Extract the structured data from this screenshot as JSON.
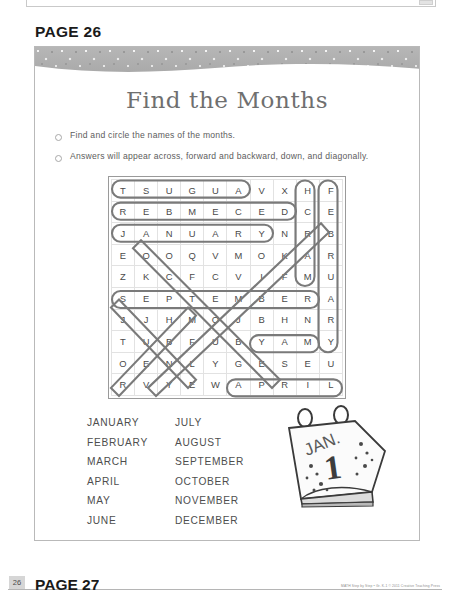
{
  "page_heading": "PAGE 26",
  "next_page_heading": "PAGE 27",
  "worksheet": {
    "title": "Find the Months",
    "instructions": [
      "Find and circle the names of the months.",
      "Answers will appear across, forward and backward, down, and diagonally."
    ],
    "bullet_icon": "circle-outline-icon"
  },
  "puzzle": {
    "type": "word-search",
    "rows": 10,
    "cols": 10,
    "grid": [
      [
        "T",
        "S",
        "U",
        "G",
        "U",
        "A",
        "V",
        "X",
        "H",
        "F"
      ],
      [
        "R",
        "E",
        "B",
        "M",
        "E",
        "C",
        "E",
        "D",
        "C",
        "E"
      ],
      [
        "J",
        "A",
        "N",
        "U",
        "A",
        "R",
        "Y",
        "N",
        "R",
        "B"
      ],
      [
        "E",
        "O",
        "O",
        "Q",
        "V",
        "M",
        "O",
        "K",
        "A",
        "R"
      ],
      [
        "Z",
        "K",
        "C",
        "F",
        "C",
        "V",
        "I",
        "F",
        "M",
        "U"
      ],
      [
        "S",
        "E",
        "P",
        "T",
        "E",
        "M",
        "B",
        "E",
        "R",
        "A"
      ],
      [
        "J",
        "J",
        "H",
        "M",
        "O",
        "J",
        "B",
        "H",
        "N",
        "R"
      ],
      [
        "T",
        "U",
        "B",
        "F",
        "U",
        "B",
        "Y",
        "A",
        "M",
        "Y"
      ],
      [
        "O",
        "E",
        "N",
        "L",
        "Y",
        "G",
        "E",
        "S",
        "E",
        "U"
      ],
      [
        "R",
        "V",
        "Y",
        "E",
        "W",
        "A",
        "P",
        "R",
        "I",
        "L"
      ]
    ],
    "solutions": [
      {
        "word": "AUGUST",
        "direction": "backward",
        "start": [
          0,
          5
        ],
        "end": [
          0,
          0
        ]
      },
      {
        "word": "DECEMBER",
        "direction": "backward",
        "start": [
          1,
          7
        ],
        "end": [
          1,
          0
        ]
      },
      {
        "word": "JANUARY",
        "direction": "forward",
        "start": [
          2,
          0
        ],
        "end": [
          2,
          6
        ]
      },
      {
        "word": "SEPTEMBER",
        "direction": "forward",
        "start": [
          5,
          0
        ],
        "end": [
          5,
          8
        ]
      },
      {
        "word": "MAY",
        "direction": "forward",
        "start": [
          7,
          6
        ],
        "end": [
          7,
          8
        ]
      },
      {
        "word": "APRIL",
        "direction": "forward",
        "start": [
          9,
          5
        ],
        "end": [
          9,
          9
        ]
      },
      {
        "word": "MARCH",
        "direction": "up",
        "start": [
          4,
          8
        ],
        "end": [
          0,
          8
        ]
      },
      {
        "word": "FEBRUARY",
        "direction": "down",
        "start": [
          0,
          9
        ],
        "end": [
          7,
          9
        ]
      },
      {
        "word": "OCTOBER",
        "direction": "diagonal-down-right",
        "start": [
          3,
          1
        ],
        "end": [
          9,
          7
        ]
      },
      {
        "word": "NOVEMBER",
        "direction": "diagonal-up-right",
        "start": [
          9,
          2
        ],
        "end": [
          2,
          9
        ]
      },
      {
        "word": "JUNE",
        "direction": "diagonal-down-right",
        "start": [
          6,
          0
        ],
        "end": [
          9,
          3
        ]
      },
      {
        "word": "JULY",
        "direction": "diagonal-up-right",
        "start": [
          9,
          0
        ],
        "end": [
          6,
          3
        ]
      }
    ]
  },
  "word_list": {
    "column_left": [
      "JANUARY",
      "FEBRUARY",
      "MARCH",
      "APRIL",
      "MAY",
      "JUNE"
    ],
    "column_right": [
      "JULY",
      "AUGUST",
      "SEPTEMBER",
      "OCTOBER",
      "NOVEMBER",
      "DECEMBER"
    ]
  },
  "illustration": {
    "name": "desk-calendar-icon",
    "month_label": "JAN.",
    "day_label": "1"
  },
  "footer": {
    "page_number": "26",
    "credit": "MATH Step by Step • Gr. K-1 © 2011 Creative Teaching Press"
  },
  "colors": {
    "band": "#b0b0b0",
    "title_text": "#6f6f6f",
    "body_text": "#5d5d5d",
    "grid_letter": "#4a4a4a",
    "circle_stroke": "#7a7a7a"
  }
}
